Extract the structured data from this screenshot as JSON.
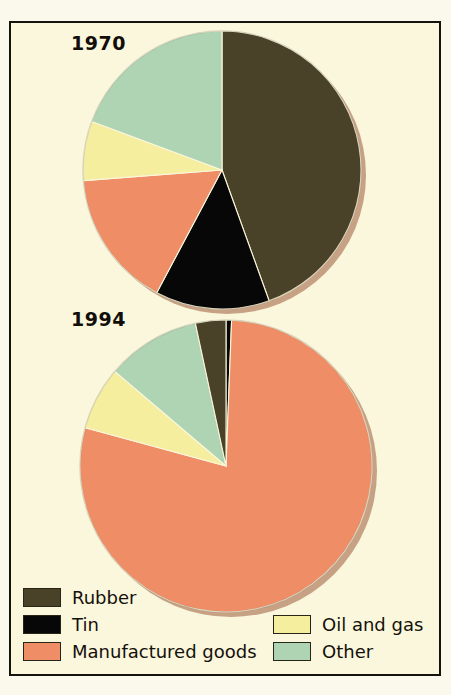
{
  "figure": {
    "background_color": "#fbf7dc",
    "frame_color": "#15130d"
  },
  "years": {
    "first": "1970",
    "second": "1994"
  },
  "legend": {
    "items": [
      {
        "label": "Rubber",
        "color": "#4a4228",
        "key": "rubber"
      },
      {
        "label": "Tin",
        "color": "#070707",
        "key": "tin"
      },
      {
        "label": "Manufactured goods",
        "color": "#ef8e66",
        "key": "manufactured-goods"
      },
      {
        "label": "Oil and gas",
        "color": "#f5ee9e",
        "key": "oil-and-gas"
      },
      {
        "label": "Other",
        "color": "#aed4b3",
        "key": "other"
      }
    ]
  },
  "chart_data": {
    "type": "pie",
    "title": "",
    "subtitle": "",
    "legend_position": "bottom",
    "categories": [
      "Rubber",
      "Tin",
      "Manufactured goods",
      "Oil and gas",
      "Other"
    ],
    "colors": [
      "#4a4228",
      "#070707",
      "#ef8e66",
      "#f5ee9e",
      "#aed4b3"
    ],
    "charts": [
      {
        "name": "1970",
        "label": "1970",
        "center": [
          147,
          145
        ],
        "radius": 139,
        "start_angle_deg": 0,
        "direction": "clockwise",
        "slices": [
          {
            "category": "Rubber",
            "value": 44.5,
            "color": "#4a4228",
            "start_deg": 0,
            "end_deg": 160.2
          },
          {
            "category": "Tin",
            "value": 13.3,
            "color": "#070707",
            "start_deg": 160.2,
            "end_deg": 208.0
          },
          {
            "category": "Manufactured goods",
            "value": 16.0,
            "color": "#ef8e66",
            "start_deg": 208.0,
            "end_deg": 265.6
          },
          {
            "category": "Oil and gas",
            "value": 6.9,
            "color": "#f5ee9e",
            "start_deg": 265.6,
            "end_deg": 290.4
          },
          {
            "category": "Other",
            "value": 19.3,
            "color": "#aed4b3",
            "start_deg": 290.4,
            "end_deg": 360.0
          }
        ]
      },
      {
        "name": "1994",
        "label": "1994",
        "center": [
          155,
          160
        ],
        "radius": 146,
        "start_angle_deg": 0,
        "direction": "clockwise",
        "slices": [
          {
            "category": "Tin",
            "value": 0.6,
            "color": "#070707",
            "start_deg": 0,
            "end_deg": 2.2
          },
          {
            "category": "Manufactured goods",
            "value": 78.6,
            "color": "#ef8e66",
            "start_deg": 2.2,
            "end_deg": 285.2
          },
          {
            "category": "Oil and gas",
            "value": 7.0,
            "color": "#f5ee9e",
            "start_deg": 285.2,
            "end_deg": 310.4
          },
          {
            "category": "Other",
            "value": 10.4,
            "color": "#aed4b3",
            "start_deg": 310.4,
            "end_deg": 347.9
          },
          {
            "category": "Rubber",
            "value": 3.4,
            "color": "#4a4228",
            "start_deg": 347.9,
            "end_deg": 360.0
          }
        ]
      }
    ]
  }
}
